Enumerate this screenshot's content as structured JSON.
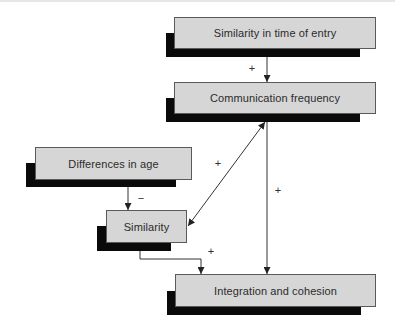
{
  "diagram": {
    "nodes": [
      {
        "id": "time-of-entry",
        "label": "Similarity in time of entry"
      },
      {
        "id": "communication-frequency",
        "label": "Communication frequency"
      },
      {
        "id": "differences-in-age",
        "label": "Differences in age"
      },
      {
        "id": "similarity",
        "label": "Similarity"
      },
      {
        "id": "integration-cohesion",
        "label": "Integration and cohesion"
      }
    ],
    "edges": [
      {
        "from": "Similarity in time of entry",
        "to": "Communication frequency",
        "sign": "+"
      },
      {
        "from": "Communication frequency",
        "to": "Similarity",
        "sign": "+",
        "bidirectional": true
      },
      {
        "from": "Communication frequency",
        "to": "Integration and cohesion",
        "sign": "+"
      },
      {
        "from": "Differences in age",
        "to": "Similarity",
        "sign": "−"
      },
      {
        "from": "Similarity",
        "to": "Integration and cohesion",
        "sign": "+"
      }
    ],
    "colors": {
      "box_fill": "#d6d6d6",
      "box_shadow": "#0a0a0a",
      "line": "#333333",
      "text": "#2b2b2b"
    }
  }
}
